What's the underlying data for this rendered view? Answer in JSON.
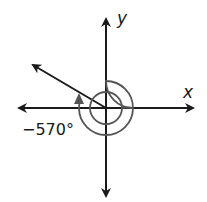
{
  "diagram": {
    "type": "angle-in-standard-position",
    "angle_label": "−570°",
    "angle_degrees": -570,
    "axes": {
      "x_label": "x",
      "y_label": "y"
    },
    "colors": {
      "axis": "#1a1a1a",
      "ray": "#1a1a1a",
      "rotation_arc": "#555555",
      "background": "#ffffff"
    },
    "geometry": {
      "origin": [
        106,
        108
      ],
      "terminal_ray_end": [
        33,
        65
      ],
      "inner_radius": 16,
      "outer_radius": 27
    }
  }
}
